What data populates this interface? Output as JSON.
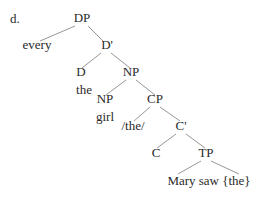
{
  "example_label": "d.",
  "tree": {
    "nodes": {
      "dp": "DP",
      "every": "every",
      "dbar": "D'",
      "d": "D",
      "the": "the",
      "np_top": "NP",
      "np": "NP",
      "girl": "girl",
      "cp": "CP",
      "the_slash": "/the/",
      "cbar": "C'",
      "c": "C",
      "tp": "TP",
      "tp_content": "Mary saw {the}"
    },
    "line_color": "#8a8a8a"
  }
}
